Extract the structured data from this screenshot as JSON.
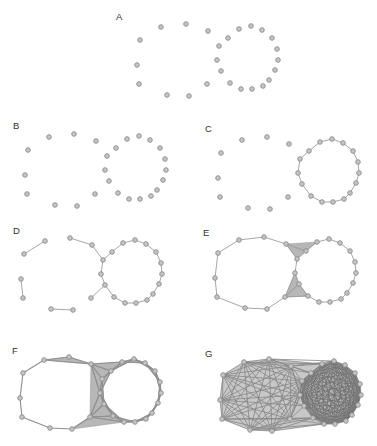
{
  "figure": {
    "background": "#ffffff",
    "node_fill": "#c6c6c6",
    "node_stroke": "#8a8a8a",
    "node_radius": 2.3,
    "edge_color": "#9c9c9c",
    "triangle_fill": "#b7b7b7",
    "hull_fill": "#c8c8c8",
    "label_color": "#2f2f2f"
  },
  "canonical_nodes": [
    [
      13,
      25
    ],
    [
      34,
      12
    ],
    [
      59,
      9
    ],
    [
      81,
      16
    ],
    [
      10,
      50
    ],
    [
      12,
      69
    ],
    [
      40,
      80
    ],
    [
      62,
      81
    ],
    [
      80,
      69
    ],
    [
      112,
      14
    ],
    [
      124,
      11
    ],
    [
      135,
      15
    ],
    [
      145,
      23
    ],
    [
      150,
      34
    ],
    [
      151,
      45
    ],
    [
      148,
      55
    ],
    [
      142,
      65
    ],
    [
      136,
      71
    ],
    [
      125,
      74
    ],
    [
      114,
      74
    ],
    [
      103,
      68
    ],
    [
      94,
      56
    ],
    [
      90,
      45
    ],
    [
      92,
      31
    ],
    [
      101,
      23
    ]
  ],
  "panels": [
    {
      "id": "A",
      "label": "A",
      "label_pos": [
        116,
        12
      ],
      "offset": [
        127,
        15
      ],
      "edge_width": 0.9,
      "edges": [],
      "triangles": []
    },
    {
      "id": "B",
      "label": "B",
      "label_pos": [
        13,
        121
      ],
      "offset": [
        15,
        125
      ],
      "edge_width": 0.9,
      "edges": [],
      "triangles": []
    },
    {
      "id": "C",
      "label": "C",
      "label_pos": [
        205,
        124
      ],
      "offset": [
        208,
        128
      ],
      "edge_width": 0.9,
      "edges": [
        [
          9,
          10
        ],
        [
          10,
          11
        ],
        [
          11,
          12
        ],
        [
          12,
          13
        ],
        [
          13,
          14
        ],
        [
          14,
          15
        ],
        [
          15,
          16
        ],
        [
          16,
          17
        ],
        [
          17,
          18
        ],
        [
          18,
          19
        ],
        [
          19,
          20
        ],
        [
          20,
          21
        ],
        [
          21,
          22
        ],
        [
          22,
          23
        ],
        [
          23,
          24
        ],
        [
          24,
          9
        ]
      ],
      "triangles": []
    },
    {
      "id": "D",
      "label": "D",
      "label_pos": [
        13,
        226
      ],
      "offset": [
        11,
        229
      ],
      "edge_width": 0.9,
      "edges": [
        [
          9,
          10
        ],
        [
          10,
          11
        ],
        [
          11,
          12
        ],
        [
          12,
          13
        ],
        [
          13,
          14
        ],
        [
          14,
          15
        ],
        [
          15,
          16
        ],
        [
          16,
          17
        ],
        [
          17,
          18
        ],
        [
          18,
          19
        ],
        [
          19,
          20
        ],
        [
          20,
          21
        ],
        [
          21,
          22
        ],
        [
          22,
          23
        ],
        [
          23,
          24
        ],
        [
          24,
          9
        ],
        [
          0,
          1
        ],
        [
          2,
          3
        ],
        [
          3,
          23
        ],
        [
          4,
          5
        ],
        [
          6,
          7
        ],
        [
          8,
          21
        ]
      ],
      "triangles": []
    },
    {
      "id": "E",
      "label": "E",
      "label_pos": [
        203,
        228
      ],
      "offset": [
        205,
        228
      ],
      "edge_width": 0.9,
      "edges": [
        [
          9,
          10
        ],
        [
          10,
          11
        ],
        [
          11,
          12
        ],
        [
          12,
          13
        ],
        [
          13,
          14
        ],
        [
          14,
          15
        ],
        [
          15,
          16
        ],
        [
          16,
          17
        ],
        [
          17,
          18
        ],
        [
          18,
          19
        ],
        [
          19,
          20
        ],
        [
          20,
          21
        ],
        [
          21,
          22
        ],
        [
          22,
          23
        ],
        [
          23,
          24
        ],
        [
          24,
          9
        ],
        [
          0,
          1
        ],
        [
          1,
          2
        ],
        [
          2,
          3
        ],
        [
          0,
          4
        ],
        [
          4,
          5
        ],
        [
          5,
          6
        ],
        [
          6,
          7
        ],
        [
          7,
          8
        ],
        [
          3,
          23
        ],
        [
          3,
          24
        ],
        [
          8,
          20
        ],
        [
          8,
          21
        ],
        [
          8,
          22
        ]
      ],
      "triangles": [
        [
          3,
          23,
          24
        ],
        [
          3,
          24,
          9
        ],
        [
          8,
          22,
          21
        ],
        [
          8,
          21,
          20
        ]
      ]
    },
    {
      "id": "F",
      "label": "F",
      "label_pos": [
        12,
        346
      ],
      "offset": [
        10,
        348
      ],
      "edge_width": 1.15,
      "edge_color": "#8f8f8f",
      "edges": [
        [
          9,
          10
        ],
        [
          10,
          11
        ],
        [
          11,
          12
        ],
        [
          12,
          13
        ],
        [
          13,
          14
        ],
        [
          14,
          15
        ],
        [
          15,
          16
        ],
        [
          16,
          17
        ],
        [
          17,
          18
        ],
        [
          18,
          19
        ],
        [
          19,
          20
        ],
        [
          20,
          21
        ],
        [
          21,
          22
        ],
        [
          22,
          23
        ],
        [
          23,
          24
        ],
        [
          24,
          9
        ],
        [
          0,
          1
        ],
        [
          1,
          2
        ],
        [
          2,
          3
        ],
        [
          0,
          4
        ],
        [
          4,
          5
        ],
        [
          5,
          6
        ],
        [
          6,
          7
        ],
        [
          7,
          8
        ],
        [
          3,
          23
        ],
        [
          3,
          24
        ],
        [
          3,
          9
        ],
        [
          3,
          22
        ],
        [
          8,
          19
        ],
        [
          8,
          20
        ],
        [
          8,
          21
        ],
        [
          8,
          22
        ],
        [
          1,
          3
        ],
        [
          9,
          11
        ],
        [
          10,
          12
        ],
        [
          11,
          13
        ],
        [
          12,
          14
        ],
        [
          13,
          15
        ],
        [
          14,
          16
        ],
        [
          15,
          17
        ],
        [
          16,
          18
        ],
        [
          17,
          19
        ],
        [
          18,
          20
        ],
        [
          19,
          21
        ],
        [
          20,
          22
        ],
        [
          21,
          23
        ],
        [
          22,
          24
        ],
        [
          23,
          9
        ],
        [
          24,
          10
        ]
      ],
      "triangles": [
        [
          1,
          2,
          3
        ],
        [
          3,
          23,
          24
        ],
        [
          3,
          24,
          9
        ],
        [
          3,
          23,
          22
        ],
        [
          3,
          22,
          8
        ],
        [
          8,
          22,
          21
        ],
        [
          8,
          21,
          20
        ],
        [
          8,
          20,
          19
        ],
        [
          7,
          8,
          19
        ],
        [
          9,
          10,
          11
        ],
        [
          10,
          11,
          12
        ],
        [
          11,
          12,
          13
        ],
        [
          12,
          13,
          14
        ],
        [
          13,
          14,
          15
        ],
        [
          14,
          15,
          16
        ],
        [
          15,
          16,
          17
        ],
        [
          16,
          17,
          18
        ],
        [
          17,
          18,
          19
        ],
        [
          18,
          19,
          20
        ],
        [
          19,
          20,
          21
        ],
        [
          20,
          21,
          22
        ],
        [
          21,
          22,
          23
        ],
        [
          22,
          23,
          24
        ],
        [
          23,
          24,
          9
        ],
        [
          24,
          9,
          10
        ]
      ]
    },
    {
      "id": "G",
      "label": "G",
      "label_pos": [
        205,
        349
      ],
      "offset": [
        210,
        350
      ],
      "edge_width": 0.8,
      "edge_color": "#858585",
      "hull": [
        0,
        1,
        2,
        9,
        10,
        11,
        12,
        13,
        14,
        15,
        16,
        17,
        18,
        19,
        7,
        6,
        5,
        4
      ],
      "fills": [
        {
          "nodes": [
            9,
            10,
            11,
            12,
            13,
            14,
            15,
            16,
            17,
            18,
            19,
            20,
            21,
            22,
            23,
            24
          ],
          "color": "#b2b2b2"
        }
      ],
      "cliques": [
        {
          "nodes": [
            0,
            1,
            2,
            3,
            4,
            5,
            6,
            7,
            8,
            22,
            23
          ],
          "color": "#858585",
          "width": 0.8
        },
        {
          "nodes": [
            9,
            10,
            11,
            12,
            13,
            14,
            15,
            16,
            17,
            18,
            19,
            20,
            21,
            22,
            23,
            24
          ],
          "color": "#6e6e6e",
          "width": 0.7
        }
      ],
      "edges": [
        [
          1,
          9
        ],
        [
          2,
          9
        ],
        [
          2,
          24
        ],
        [
          2,
          10
        ],
        [
          3,
          9
        ],
        [
          3,
          10
        ],
        [
          3,
          21
        ],
        [
          3,
          24
        ],
        [
          1,
          24
        ],
        [
          0,
          21
        ],
        [
          4,
          21
        ],
        [
          5,
          20
        ],
        [
          6,
          19
        ],
        [
          6,
          20
        ],
        [
          7,
          19
        ],
        [
          7,
          20
        ],
        [
          8,
          19
        ],
        [
          8,
          20
        ],
        [
          8,
          21
        ],
        [
          8,
          24
        ]
      ],
      "triangles": []
    }
  ]
}
